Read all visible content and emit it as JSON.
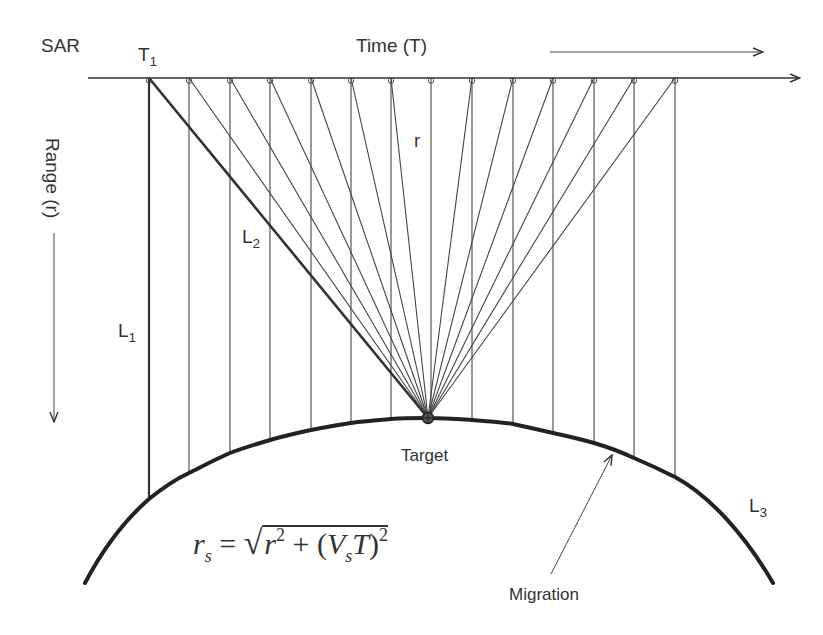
{
  "labels": {
    "sar": "SAR",
    "t1": "T",
    "t1_sub": "1",
    "time": "Time (T)",
    "range": "Range (r)",
    "r": "r",
    "l1": "L",
    "l1_sub": "1",
    "l2": "L",
    "l2_sub": "2",
    "l3": "L",
    "l3_sub": "3",
    "target": "Target",
    "migration": "Migration"
  },
  "equation": {
    "lhs_var": "r",
    "lhs_sub": "s",
    "equals": "=",
    "sqrt_symbol": "√",
    "r": "r",
    "r_exp": "2",
    "plus": "+",
    "open_paren": "(",
    "v": "V",
    "v_sub": "s",
    "t": "T",
    "close_paren": ")",
    "paren_exp": "2",
    "text": "r_s = sqrt(r^2 + (V_s T)^2)"
  },
  "colors": {
    "ink": "#333333",
    "background": "#ffffff"
  },
  "geometry": {
    "time_axis_y": 78,
    "time_axis_x_start": 88,
    "time_axis_x_end": 800,
    "target": [
      428,
      418
    ],
    "sample_positions_x": [
      149,
      189,
      230,
      270,
      311,
      351,
      391,
      431,
      472,
      513,
      553,
      594,
      634,
      675
    ],
    "curve_y_at_samples": [
      499,
      473,
      453,
      440,
      430,
      423,
      420,
      418,
      420,
      424,
      433,
      443,
      458,
      477
    ],
    "curve_start": [
      85,
      583
    ],
    "curve_end": [
      773,
      583
    ]
  }
}
